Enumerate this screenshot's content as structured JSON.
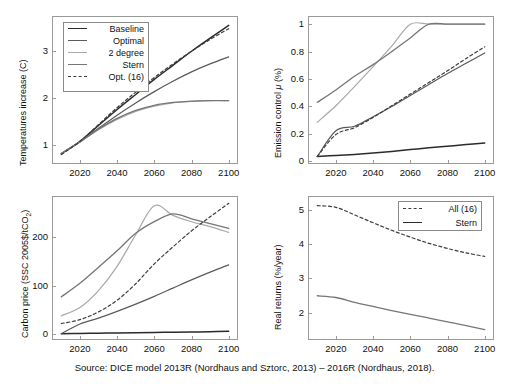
{
  "figure": {
    "caption": "Source: DICE model 2013R (Nordhaus and Sztorc, 2013) – 2016R (Nordhaus, 2018).",
    "colors": {
      "baseline": "#2b2b2b",
      "optimal": "#5a5a5a",
      "two_degree": "#a8a8a8",
      "stern": "#767676",
      "opt16": "#3d3d3d",
      "axis": "#9a9a9a"
    }
  },
  "legend_main": {
    "items": [
      {
        "label": "Baseline",
        "style": "solid"
      },
      {
        "label": "Optimal",
        "style": "solid"
      },
      {
        "label": "2 degree",
        "style": "solid"
      },
      {
        "label": "Stern",
        "style": "solid"
      },
      {
        "label": "Opt. (16)",
        "style": "dashed"
      }
    ]
  },
  "legend_returns": {
    "items": [
      {
        "label": "All (16)",
        "style": "dashed"
      },
      {
        "label": "Stern",
        "style": "solid"
      }
    ]
  },
  "chart_data": [
    {
      "type": "line",
      "panel": "top-left",
      "title": "",
      "xlabel": "",
      "ylabel": "Temperatures increase (C)",
      "xlim": [
        2005,
        2105
      ],
      "ylim": [
        0.6,
        3.75
      ],
      "xticks": [
        2020,
        2040,
        2060,
        2080,
        2100
      ],
      "yticks": [
        1,
        2,
        3
      ],
      "grid": false,
      "x": [
        2010,
        2020,
        2030,
        2040,
        2050,
        2060,
        2070,
        2080,
        2090,
        2100
      ],
      "series": [
        {
          "name": "Baseline",
          "style": "solid",
          "values": [
            0.82,
            1.08,
            1.42,
            1.76,
            2.08,
            2.4,
            2.7,
            3.0,
            3.28,
            3.55
          ]
        },
        {
          "name": "Optimal",
          "style": "solid",
          "values": [
            0.82,
            1.07,
            1.36,
            1.64,
            1.9,
            2.14,
            2.36,
            2.56,
            2.73,
            2.88
          ]
        },
        {
          "name": "2 degree",
          "style": "solid",
          "values": [
            0.82,
            1.07,
            1.33,
            1.55,
            1.72,
            1.83,
            1.9,
            1.93,
            1.95,
            1.95
          ]
        },
        {
          "name": "Stern",
          "style": "solid",
          "values": [
            0.82,
            1.07,
            1.34,
            1.57,
            1.74,
            1.85,
            1.91,
            1.94,
            1.95,
            1.95
          ]
        },
        {
          "name": "Opt. (16)",
          "style": "dashed",
          "values": [
            0.8,
            1.08,
            1.44,
            1.8,
            2.13,
            2.44,
            2.73,
            3.0,
            3.25,
            3.48
          ]
        }
      ]
    },
    {
      "type": "line",
      "panel": "top-right",
      "title": "",
      "xlabel": "",
      "ylabel": "Emission control μ (%)",
      "xlim": [
        2005,
        2105
      ],
      "ylim": [
        -0.02,
        1.06
      ],
      "xticks": [
        2020,
        2040,
        2060,
        2080,
        2100
      ],
      "yticks": [
        0,
        0.2,
        0.4,
        0.6,
        0.8,
        1
      ],
      "grid": false,
      "x": [
        2010,
        2020,
        2030,
        2040,
        2050,
        2060,
        2070,
        2080,
        2090,
        2100
      ],
      "series": [
        {
          "name": "Baseline",
          "style": "solid",
          "values": [
            0.035,
            0.042,
            0.05,
            0.06,
            0.072,
            0.085,
            0.098,
            0.11,
            0.122,
            0.133
          ]
        },
        {
          "name": "Optimal",
          "style": "solid",
          "values": [
            0.035,
            0.222,
            0.255,
            0.325,
            0.4,
            0.48,
            0.56,
            0.64,
            0.715,
            0.79
          ]
        },
        {
          "name": "2 degree",
          "style": "solid",
          "values": [
            0.285,
            0.405,
            0.545,
            0.69,
            0.84,
            1.0,
            1.0,
            1.0,
            1.0,
            1.0
          ]
        },
        {
          "name": "Stern",
          "style": "solid",
          "values": [
            0.43,
            0.52,
            0.62,
            0.705,
            0.8,
            0.9,
            1.0,
            1.0,
            1.0,
            1.0
          ]
        },
        {
          "name": "Opt. (16)",
          "style": "dashed",
          "values": [
            0.035,
            0.195,
            0.245,
            0.32,
            0.405,
            0.49,
            0.575,
            0.66,
            0.75,
            0.835
          ]
        }
      ]
    },
    {
      "type": "line",
      "panel": "bottom-left",
      "title": "",
      "xlabel": "",
      "ylabel": "Carbon price (SSC 2005$/tCO2)",
      "xlim": [
        2005,
        2105
      ],
      "ylim": [
        -12,
        285
      ],
      "xticks": [
        2020,
        2040,
        2060,
        2080,
        2100
      ],
      "yticks": [
        0,
        100,
        200
      ],
      "grid": false,
      "x": [
        2010,
        2020,
        2030,
        2040,
        2050,
        2060,
        2070,
        2080,
        2090,
        2100
      ],
      "series": [
        {
          "name": "Baseline",
          "style": "solid",
          "values": [
            1,
            1.5,
            2,
            2.5,
            3,
            3.5,
            4,
            4.5,
            5,
            6
          ]
        },
        {
          "name": "Optimal",
          "style": "solid",
          "values": [
            1,
            21,
            33,
            47,
            62,
            78,
            95,
            112,
            128,
            143
          ]
        },
        {
          "name": "2 degree",
          "style": "solid",
          "values": [
            38,
            55,
            90,
            140,
            205,
            265,
            245,
            232,
            222,
            210
          ]
        },
        {
          "name": "Stern",
          "style": "solid",
          "values": [
            77,
            105,
            138,
            172,
            208,
            232,
            248,
            238,
            228,
            218
          ]
        },
        {
          "name": "Opt. (16)",
          "style": "dashed",
          "values": [
            22,
            30,
            46,
            70,
            104,
            145,
            180,
            213,
            242,
            270
          ]
        }
      ]
    },
    {
      "type": "line",
      "panel": "bottom-right",
      "title": "",
      "xlabel": "",
      "ylabel": "Real returns (%/year)",
      "xlim": [
        2005,
        2105
      ],
      "ylim": [
        1.2,
        5.4
      ],
      "xticks": [
        2020,
        2040,
        2060,
        2080,
        2100
      ],
      "yticks": [
        2,
        3,
        4,
        5
      ],
      "grid": false,
      "x": [
        2010,
        2020,
        2030,
        2040,
        2050,
        2060,
        2070,
        2080,
        2090,
        2100
      ],
      "series": [
        {
          "name": "All (16)",
          "style": "dashed",
          "values": [
            5.12,
            5.07,
            4.85,
            4.62,
            4.4,
            4.2,
            4.02,
            3.87,
            3.74,
            3.64
          ]
        },
        {
          "name": "Stern",
          "style": "solid",
          "values": [
            2.49,
            2.44,
            2.3,
            2.18,
            2.06,
            1.95,
            1.84,
            1.73,
            1.62,
            1.5
          ]
        }
      ]
    }
  ]
}
